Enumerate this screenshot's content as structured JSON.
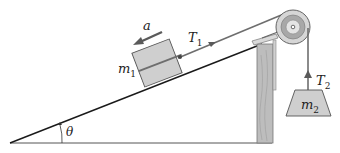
{
  "diagram": {
    "type": "physics-free-body",
    "labels": {
      "acceleration": "a",
      "tension1_base": "T",
      "tension1_sub": "1",
      "mass1_base": "m",
      "mass1_sub": "1",
      "tension2_base": "T",
      "tension2_sub": "2",
      "mass2_base": "m",
      "mass2_sub": "2",
      "angle": "θ"
    },
    "colors": {
      "line": "#1a1a1a",
      "block_fill": "#cfcfcf",
      "block_stroke": "#555555",
      "rope": "#6e6e6e",
      "wood": "#bdbdbd",
      "pulley_outer": "#d6d6d6",
      "pulley_ring": "#9a9a9a",
      "arrow": "#5a5a5a"
    }
  }
}
